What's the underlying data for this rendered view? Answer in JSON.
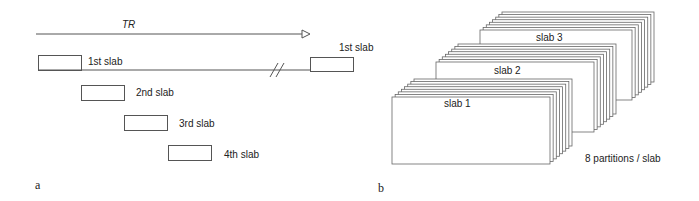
{
  "panel_a": {
    "letter": "a",
    "tr_label": "TR",
    "slabs": [
      {
        "label": "1st slab"
      },
      {
        "label": "2nd slab"
      },
      {
        "label": "3rd slab"
      },
      {
        "label": "4th slab"
      }
    ],
    "repeat_label": "1st slab",
    "break_mark": "//"
  },
  "panel_b": {
    "letter": "b",
    "slabs": [
      {
        "label": "slab 1"
      },
      {
        "label": "slab 2"
      },
      {
        "label": "slab 3"
      }
    ],
    "partitions_label": "8 partitions / slab",
    "partitions_per_slab": 8
  },
  "colors": {
    "line": "#555555",
    "text": "#222222",
    "background": "#ffffff"
  }
}
